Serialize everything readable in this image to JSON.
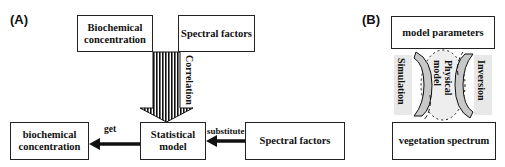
{
  "panel_a": {
    "label": "(A)",
    "boxes": {
      "biochem_top": [
        "Biochemical",
        "concentration"
      ],
      "spectral_top": "Spectral factors",
      "statistical": [
        "Statistical",
        "model"
      ],
      "biochem_bottom": [
        "biochemical",
        "concentration"
      ],
      "spectral_bottom": "Spectral factors"
    },
    "arrows": {
      "correlation": "Correlation",
      "get": "get",
      "substitute": "substitute"
    }
  },
  "panel_b": {
    "label": "(B)",
    "boxes": {
      "model_parameters": "model parameters",
      "vegetation_spectrum": "vegetation spectrum"
    },
    "center": [
      "Physical",
      "model"
    ],
    "left_label": "Simulation",
    "right_label": "Inversion"
  },
  "colors": {
    "line": "#111111",
    "shade": "#c8c8c8",
    "light_shade": "#e8e8e8"
  }
}
